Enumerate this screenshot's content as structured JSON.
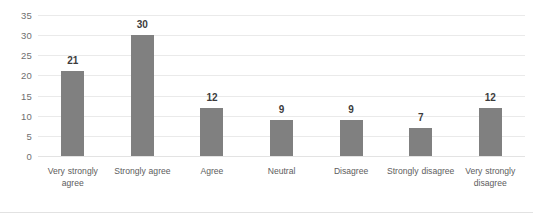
{
  "chart_data": {
    "type": "bar",
    "title": "",
    "subtitle": "",
    "xlabel": "",
    "ylabel": "",
    "categories": [
      "Very strongly agree",
      "Strongly agree",
      "Agree",
      "Neutral",
      "Disagree",
      "Strongly disagree",
      "Very strongly disagree"
    ],
    "values": [
      21,
      30,
      12,
      9,
      9,
      7,
      12
    ],
    "data_labels": [
      "21",
      "30",
      "12",
      "9",
      "9",
      "7",
      "12"
    ],
    "ylim": [
      0,
      35
    ],
    "ytick_values": [
      35,
      30,
      25,
      20,
      15,
      10,
      5,
      0
    ],
    "ytick_labels": [
      "35",
      "30",
      "25",
      "20",
      "15",
      "10",
      "5",
      "0"
    ],
    "grid": true,
    "grid_axis": "y",
    "legend": false,
    "legend_position": "none",
    "series": [
      {
        "name": "",
        "values": [
          21,
          30,
          12,
          9,
          9,
          7,
          12
        ],
        "color": "#808080"
      }
    ]
  },
  "style": {
    "bar_color": "#808080",
    "gridline_color": "#eaeaea",
    "axis_text_color": "#6f6f6f",
    "data_label_color": "#3c3c3c",
    "background": "#ffffff"
  }
}
